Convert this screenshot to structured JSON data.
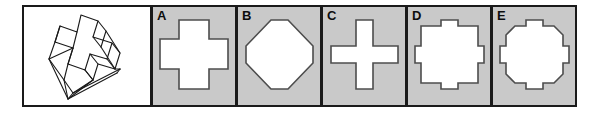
{
  "item": {
    "type": "spatial-reasoning-multiple-choice",
    "stem": {
      "figure_name": "3d-cross-prism",
      "description": "Isometric line drawing of a three-dimensional plus/cross-shaped solid block"
    },
    "options": [
      {
        "letter": "A",
        "shape_name": "thick-cross",
        "description": "Thick plus sign / Greek cross with wide arms"
      },
      {
        "letter": "B",
        "shape_name": "octagon-diamond",
        "description": "Octagon shaped like a diamond with cut corners"
      },
      {
        "letter": "C",
        "shape_name": "thin-cross",
        "description": "Thin plus sign / Greek cross with narrow arms"
      },
      {
        "letter": "D",
        "shape_name": "square-with-tabs",
        "description": "Square with small rectangular tabs on all four sides"
      },
      {
        "letter": "E",
        "shape_name": "octagon-with-tabs",
        "description": "Octagon with small rectangular tabs on all four sides"
      }
    ]
  },
  "colors": {
    "page_background": "#ffffff",
    "panel_border": "#1a1a1a",
    "option_background": "#c9c9c9",
    "shape_fill": "#ffffff",
    "shape_stroke": "#4d4d4d",
    "line_art": "#1a1a1a",
    "letter_color": "#0d0d0d"
  }
}
